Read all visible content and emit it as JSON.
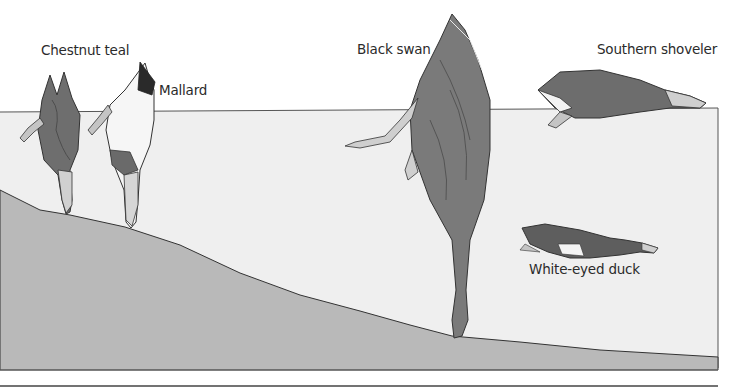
{
  "figure": {
    "colors": {
      "background": "#ffffff",
      "water": "#efefef",
      "lake_bed": "#b9b9b9",
      "outline": "#333333"
    }
  },
  "labels": {
    "chestnut_teal": "Chestnut teal",
    "mallard": "Mallard",
    "black_swan": "Black swan",
    "southern_shoveler": "Southern shoveler",
    "white_eyed_duck": "White-eyed duck"
  }
}
